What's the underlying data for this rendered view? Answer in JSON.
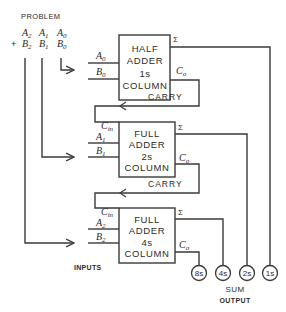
{
  "problem": {
    "title": "PROBLEM",
    "row_a": [
      {
        "var": "A",
        "sub": "2"
      },
      {
        "var": "A",
        "sub": "1"
      },
      {
        "var": "A",
        "sub": "0"
      }
    ],
    "row_b_prefix": "+",
    "row_b": [
      {
        "var": "B",
        "sub": "2"
      },
      {
        "var": "B",
        "sub": "1"
      },
      {
        "var": "B",
        "sub": "0"
      }
    ]
  },
  "adders": [
    {
      "line1": "HALF",
      "line2": "ADDER",
      "line3": "1s",
      "line4": "COLUMN",
      "in_a": {
        "var": "A",
        "sub": "0"
      },
      "in_b": {
        "var": "B",
        "sub": "0"
      },
      "sum_label": "Σ",
      "carry_out": {
        "var": "C",
        "sub": "o"
      }
    },
    {
      "line1": "FULL",
      "line2": "ADDER",
      "line3": "2s",
      "line4": "COLUMN",
      "carry_in": {
        "var": "C",
        "sub": "in"
      },
      "in_a": {
        "var": "A",
        "sub": "1"
      },
      "in_b": {
        "var": "B",
        "sub": "1"
      },
      "sum_label": "Σ",
      "carry_out": {
        "var": "C",
        "sub": "o"
      }
    },
    {
      "line1": "FULL",
      "line2": "ADDER",
      "line3": "4s",
      "line4": "COLUMN",
      "carry_in": {
        "var": "C",
        "sub": "in"
      },
      "in_a": {
        "var": "A",
        "sub": "2"
      },
      "in_b": {
        "var": "B",
        "sub": "2"
      },
      "sum_label": "Σ",
      "carry_out": {
        "var": "C",
        "sub": "o"
      }
    }
  ],
  "carry_labels": [
    "CARRY",
    "CARRY"
  ],
  "inputs_label": "INPUTS",
  "outputs": [
    "8s",
    "4s",
    "2s",
    "1s"
  ],
  "sum_output_label": {
    "line1": "SUM",
    "line2": "OUTPUT"
  }
}
